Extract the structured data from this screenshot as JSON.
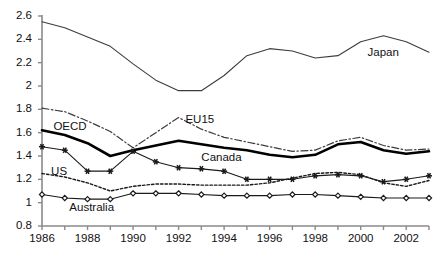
{
  "chart_data": {
    "type": "line",
    "title": "",
    "xlabel": "",
    "ylabel": "",
    "xlim": [
      1986,
      2003
    ],
    "ylim": [
      0.8,
      2.6
    ],
    "grid": false,
    "legend_position": "inline-annotations",
    "x": [
      1986,
      1987,
      1988,
      1989,
      1990,
      1991,
      1992,
      1993,
      1994,
      1995,
      1996,
      1997,
      1998,
      1999,
      2000,
      2001,
      2002,
      2003
    ],
    "xtick_labels": [
      "1986",
      "1988",
      "1990",
      "1992",
      "1994",
      "1996",
      "1998",
      "2000",
      "2002"
    ],
    "xtick_values": [
      1986,
      1988,
      1990,
      1992,
      1994,
      1996,
      1998,
      2000,
      2002
    ],
    "ytick_labels": [
      "0.8",
      "1",
      "1.2",
      "1.4",
      "1.6",
      "1.8",
      "2",
      "2.2",
      "2.4",
      "2.6"
    ],
    "ytick_values": [
      0.8,
      1.0,
      1.2,
      1.4,
      1.6,
      1.8,
      2.0,
      2.2,
      2.4,
      2.6
    ],
    "series": [
      {
        "name": "Japan",
        "style": "solid-thin",
        "marker": "none",
        "color": "#3c3c3c",
        "label_x": 2000.3,
        "label_y": 2.285,
        "values": [
          2.55,
          2.5,
          2.42,
          2.34,
          2.19,
          2.05,
          1.96,
          1.96,
          2.09,
          2.26,
          2.32,
          2.3,
          2.24,
          2.26,
          2.38,
          2.43,
          2.38,
          2.29
        ]
      },
      {
        "name": "EU15",
        "style": "dash-dot",
        "marker": "none",
        "color": "#3c3c3c",
        "label_x": 1992.3,
        "label_y": 1.705,
        "values": [
          1.81,
          1.78,
          1.7,
          1.61,
          1.47,
          1.6,
          1.73,
          1.63,
          1.56,
          1.52,
          1.48,
          1.44,
          1.45,
          1.53,
          1.56,
          1.49,
          1.45,
          1.46
        ]
      },
      {
        "name": "OECD",
        "style": "solid-thick",
        "marker": "none",
        "color": "#000000",
        "label_x": 1986.5,
        "label_y": 1.645,
        "values": [
          1.62,
          1.58,
          1.51,
          1.4,
          1.45,
          1.49,
          1.53,
          1.5,
          1.47,
          1.45,
          1.41,
          1.39,
          1.41,
          1.5,
          1.52,
          1.45,
          1.42,
          1.44
        ]
      },
      {
        "name": "Canada",
        "style": "solid-marker",
        "marker": "star",
        "color": "#1a1a1a",
        "label_x": 1993.0,
        "label_y": 1.385,
        "values": [
          1.48,
          1.45,
          1.27,
          1.27,
          1.44,
          1.35,
          1.3,
          1.29,
          1.27,
          1.2,
          1.2,
          1.2,
          1.23,
          1.24,
          1.23,
          1.18,
          1.2,
          1.23
        ]
      },
      {
        "name": "US",
        "style": "dotted",
        "marker": "none",
        "color": "#1a1a1a",
        "label_x": 1986.4,
        "label_y": 1.265,
        "values": [
          1.25,
          1.22,
          1.17,
          1.1,
          1.14,
          1.16,
          1.16,
          1.15,
          1.15,
          1.15,
          1.17,
          1.21,
          1.25,
          1.26,
          1.24,
          1.17,
          1.14,
          1.19
        ]
      },
      {
        "name": "Australia",
        "style": "solid-marker",
        "marker": "diamond",
        "color": "#1a1a1a",
        "label_x": 1987.2,
        "label_y": 0.955,
        "values": [
          1.07,
          1.04,
          1.03,
          1.03,
          1.08,
          1.08,
          1.08,
          1.07,
          1.06,
          1.06,
          1.06,
          1.07,
          1.07,
          1.06,
          1.05,
          1.04,
          1.04,
          1.04
        ]
      }
    ]
  }
}
